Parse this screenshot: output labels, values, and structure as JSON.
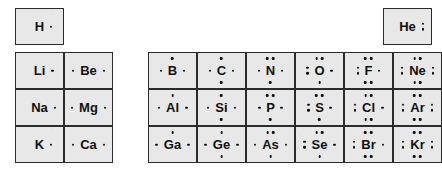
{
  "figure": {
    "kind": "lewis-dot-periodic-table",
    "cell_fill_color": "#e8e8e8",
    "border_color": "#2b2b2b",
    "text_color": "#111111",
    "background_color": "#ffffff"
  },
  "blocks": {
    "s_block": {
      "name": "s-block",
      "columns": [
        "Group 1A",
        "Group 2A"
      ],
      "rows": [
        {
          "period": "1",
          "cells": [
            {
              "symbol": "H",
              "valence_electrons": 1,
              "dots": {
                "top": 0,
                "bottom": 0,
                "left": 0,
                "right": 1
              },
              "style": "inline"
            }
          ]
        },
        {
          "period": "2",
          "cells": [
            {
              "symbol": "Li",
              "valence_electrons": 1,
              "dots": {
                "top": 0,
                "bottom": 0,
                "left": 0,
                "right": 1
              },
              "style": "inline"
            },
            {
              "symbol": "Be",
              "valence_electrons": 2,
              "dots": {
                "top": 0,
                "bottom": 0,
                "left": 1,
                "right": 1
              },
              "style": "sides"
            }
          ]
        },
        {
          "period": "3",
          "cells": [
            {
              "symbol": "Na",
              "valence_electrons": 1,
              "dots": {
                "top": 0,
                "bottom": 0,
                "left": 0,
                "right": 1
              },
              "style": "sides"
            },
            {
              "symbol": "Mg",
              "valence_electrons": 2,
              "dots": {
                "top": 0,
                "bottom": 0,
                "left": 1,
                "right": 1
              },
              "style": "sides"
            }
          ]
        },
        {
          "period": "4",
          "cells": [
            {
              "symbol": "K",
              "valence_electrons": 1,
              "dots": {
                "top": 0,
                "bottom": 0,
                "left": 0,
                "right": 1
              },
              "style": "inline"
            },
            {
              "symbol": "Ca",
              "valence_electrons": 2,
              "dots": {
                "top": 0,
                "bottom": 0,
                "left": 1,
                "right": 1
              },
              "style": "sides"
            }
          ]
        }
      ]
    },
    "p_block": {
      "name": "p-block",
      "columns": [
        "Group 3A",
        "Group 4A",
        "Group 5A",
        "Group 6A",
        "Group 7A",
        "Group 8A"
      ],
      "rows": [
        {
          "period": "1",
          "cells": [
            {
              "symbol": "He",
              "valence_electrons": 2,
              "dots": {
                "top": 0,
                "bottom": 0,
                "left": 0,
                "right": 2
              },
              "style": "inline"
            }
          ]
        },
        {
          "period": "2",
          "cells": [
            {
              "symbol": "B",
              "valence_electrons": 3,
              "dots": {
                "top": 1,
                "bottom": 0,
                "left": 1,
                "right": 1
              },
              "style": "sides"
            },
            {
              "symbol": "C",
              "valence_electrons": 4,
              "dots": {
                "top": 1,
                "bottom": 1,
                "left": 1,
                "right": 1
              },
              "style": "sides"
            },
            {
              "symbol": "N",
              "valence_electrons": 5,
              "dots": {
                "top": 2,
                "bottom": 1,
                "left": 1,
                "right": 1
              },
              "style": "sides"
            },
            {
              "symbol": "O",
              "valence_electrons": 6,
              "dots": {
                "top": 2,
                "bottom": 1,
                "left": 2,
                "right": 1
              },
              "style": "sides"
            },
            {
              "symbol": "F",
              "valence_electrons": 7,
              "dots": {
                "top": 2,
                "bottom": 2,
                "left": 2,
                "right": 1
              },
              "style": "sides"
            },
            {
              "symbol": "Ne",
              "valence_electrons": 8,
              "dots": {
                "top": 2,
                "bottom": 2,
                "left": 2,
                "right": 2
              },
              "style": "sides"
            }
          ]
        },
        {
          "period": "3",
          "cells": [
            {
              "symbol": "Al",
              "valence_electrons": 3,
              "dots": {
                "top": 1,
                "bottom": 0,
                "left": 1,
                "right": 1
              },
              "style": "sides"
            },
            {
              "symbol": "Si",
              "valence_electrons": 4,
              "dots": {
                "top": 1,
                "bottom": 1,
                "left": 1,
                "right": 1
              },
              "style": "sides"
            },
            {
              "symbol": "P",
              "valence_electrons": 5,
              "dots": {
                "top": 2,
                "bottom": 1,
                "left": 1,
                "right": 1
              },
              "style": "sides"
            },
            {
              "symbol": "S",
              "valence_electrons": 6,
              "dots": {
                "top": 2,
                "bottom": 1,
                "left": 2,
                "right": 1
              },
              "style": "sides"
            },
            {
              "symbol": "Cl",
              "valence_electrons": 7,
              "dots": {
                "top": 2,
                "bottom": 2,
                "left": 2,
                "right": 1
              },
              "style": "sides"
            },
            {
              "symbol": "Ar",
              "valence_electrons": 8,
              "dots": {
                "top": 2,
                "bottom": 2,
                "left": 2,
                "right": 2
              },
              "style": "sides"
            }
          ]
        },
        {
          "period": "4",
          "cells": [
            {
              "symbol": "Ga",
              "valence_electrons": 3,
              "dots": {
                "top": 1,
                "bottom": 0,
                "left": 1,
                "right": 1
              },
              "style": "sides"
            },
            {
              "symbol": "Ge",
              "valence_electrons": 4,
              "dots": {
                "top": 1,
                "bottom": 1,
                "left": 1,
                "right": 1
              },
              "style": "sides"
            },
            {
              "symbol": "As",
              "valence_electrons": 5,
              "dots": {
                "top": 2,
                "bottom": 1,
                "left": 1,
                "right": 1
              },
              "style": "sides"
            },
            {
              "symbol": "Se",
              "valence_electrons": 6,
              "dots": {
                "top": 2,
                "bottom": 1,
                "left": 2,
                "right": 1
              },
              "style": "sides"
            },
            {
              "symbol": "Br",
              "valence_electrons": 7,
              "dots": {
                "top": 2,
                "bottom": 2,
                "left": 2,
                "right": 1
              },
              "style": "sides"
            },
            {
              "symbol": "Kr",
              "valence_electrons": 8,
              "dots": {
                "top": 2,
                "bottom": 2,
                "left": 2,
                "right": 2
              },
              "style": "sides"
            }
          ]
        }
      ]
    }
  },
  "layout": {
    "s_block_left": 15,
    "p_block_left": 148,
    "cell_width": 49,
    "cell_height": 37,
    "row_tops": [
      8,
      52,
      89,
      126
    ],
    "helium_left": 383
  }
}
